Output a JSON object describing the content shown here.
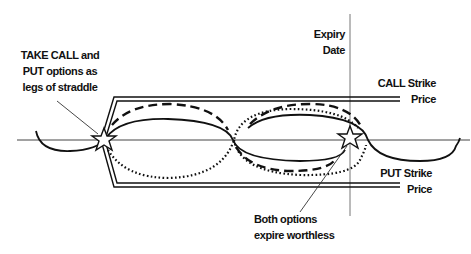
{
  "diagram": {
    "labels": {
      "take_legs_line1": "TAKE CALL and",
      "take_legs_line2": "PUT options as",
      "take_legs_line3": "legs of straddle",
      "expiry_line1": "Expiry",
      "expiry_line2": "Date",
      "call_strike_line1": "CALL Strike",
      "call_strike_line2": "Price",
      "put_strike_line1": "PUT Strike",
      "put_strike_line2": "Price",
      "worthless_line1": "Both options",
      "worthless_line2": "expire worthless"
    },
    "markers": [
      {
        "name": "entry-star",
        "x": 104,
        "y": 140
      },
      {
        "name": "expiry-star",
        "x": 350,
        "y": 138
      }
    ],
    "lines": {
      "price_axis_y": 140,
      "expiry_x": 350,
      "call_strike_y": 99,
      "put_strike_y": 185
    },
    "legend_styles": {
      "underlying_price": "solid",
      "call_path": "dashed",
      "put_path": "dotted"
    },
    "colors": {
      "stroke": "#111111",
      "thin_line": "#555555",
      "background": "#ffffff"
    }
  }
}
